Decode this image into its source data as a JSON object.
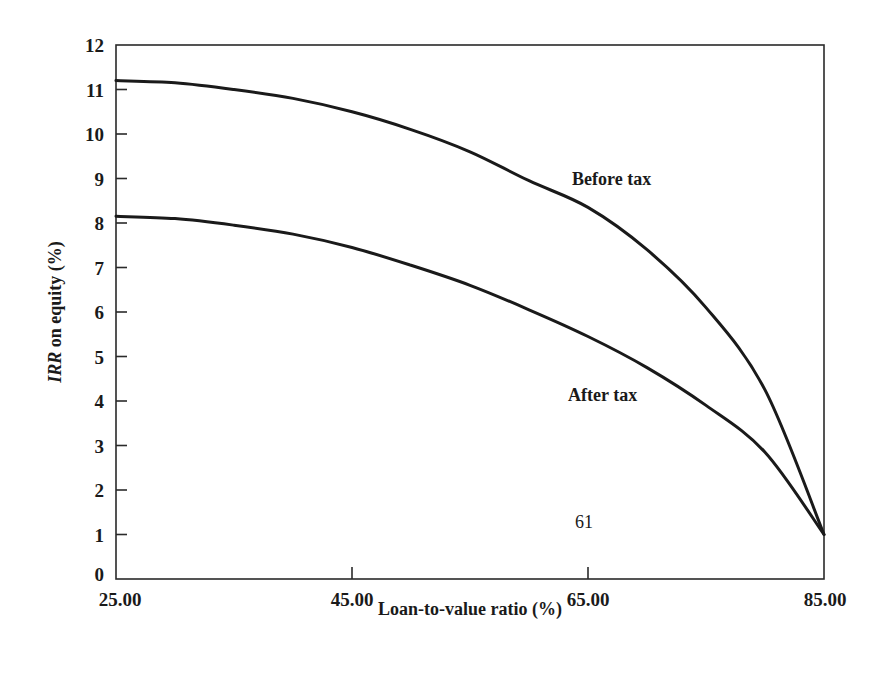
{
  "chart_data": {
    "type": "line",
    "title": "",
    "xlabel": "Loan-to-value ratio (%)",
    "ylabel_italic": "IRR",
    "ylabel_rest": " on equity (%)",
    "ylabel": "IRR on equity (%)",
    "xlim": [
      25,
      85
    ],
    "ylim": [
      0,
      12
    ],
    "grid": false,
    "legend": "inline labels",
    "x_ticks": [
      25,
      45,
      65,
      85
    ],
    "x_tick_labels": [
      "25.00",
      "45.00",
      "65.00",
      "85.00"
    ],
    "y_ticks": [
      0,
      1,
      2,
      3,
      4,
      5,
      6,
      7,
      8,
      9,
      10,
      11,
      12
    ],
    "y_tick_labels": [
      "0",
      "1",
      "2",
      "3",
      "4",
      "5",
      "6",
      "7",
      "8",
      "9",
      "10",
      "11",
      "12"
    ],
    "x": [
      25,
      30,
      35,
      40,
      45,
      50,
      55,
      60,
      65,
      70,
      75,
      80,
      85
    ],
    "series": [
      {
        "name": "Before tax",
        "values": [
          11.2,
          11.15,
          11.0,
          10.8,
          10.5,
          10.1,
          9.6,
          8.95,
          8.35,
          7.4,
          6.1,
          4.25,
          1.0
        ],
        "label_pos": [
          572,
          185
        ]
      },
      {
        "name": "After tax",
        "values": [
          8.15,
          8.1,
          7.95,
          7.75,
          7.45,
          7.05,
          6.6,
          6.05,
          5.45,
          4.75,
          3.9,
          2.85,
          1.0
        ],
        "label_pos": [
          568,
          401
        ]
      }
    ],
    "annotations": [
      {
        "text": "61",
        "pos": [
          575,
          528
        ]
      }
    ]
  },
  "colors": {
    "line": "#1a1a1a",
    "axis": "#2a2a2a",
    "background": "#ffffff"
  }
}
